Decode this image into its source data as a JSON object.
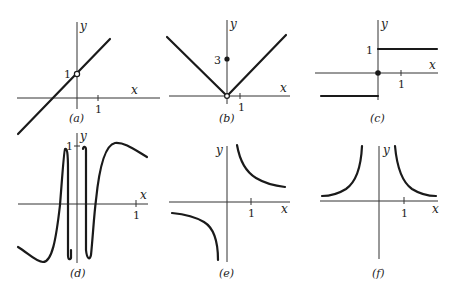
{
  "figure": {
    "panels": [
      {
        "id": "a",
        "caption": "(a)",
        "x_label": "x",
        "y_label": "y",
        "x_tick": "1",
        "y_tick": "1",
        "description": "Straight line y = x + 1 with open circle (hole) at (0, 1)"
      },
      {
        "id": "b",
        "caption": "(b)",
        "x_label": "x",
        "y_label": "y",
        "x_tick": "1",
        "y_tick": "3",
        "description": "V-shaped absolute value graph with vertex open circle at origin and filled point at (0, 3)"
      },
      {
        "id": "c",
        "caption": "(c)",
        "x_label": "x",
        "y_label": "y",
        "x_tick": "1",
        "y_tick": "1",
        "description": "Step function: y = 1 for x > 0, y = -1 for x < 0, filled dot at origin"
      },
      {
        "id": "d",
        "caption": "(d)",
        "x_label": "x",
        "y_label": "y",
        "x_tick": "1",
        "y_tick": "1",
        "description": "Oscillating curve like sin(1/x) oscillating rapidly between -1 and 1 near x = 0"
      },
      {
        "id": "e",
        "caption": "(e)",
        "x_label": "x",
        "y_label": "y",
        "x_tick": "1",
        "description": "Hyperbola y = 1/x with branches in first and third quadrants"
      },
      {
        "id": "f",
        "caption": "(f)",
        "x_label": "x",
        "y_label": "y",
        "x_tick": "1",
        "description": "Graph of y = 1/x^2 with both branches above x-axis"
      }
    ]
  }
}
